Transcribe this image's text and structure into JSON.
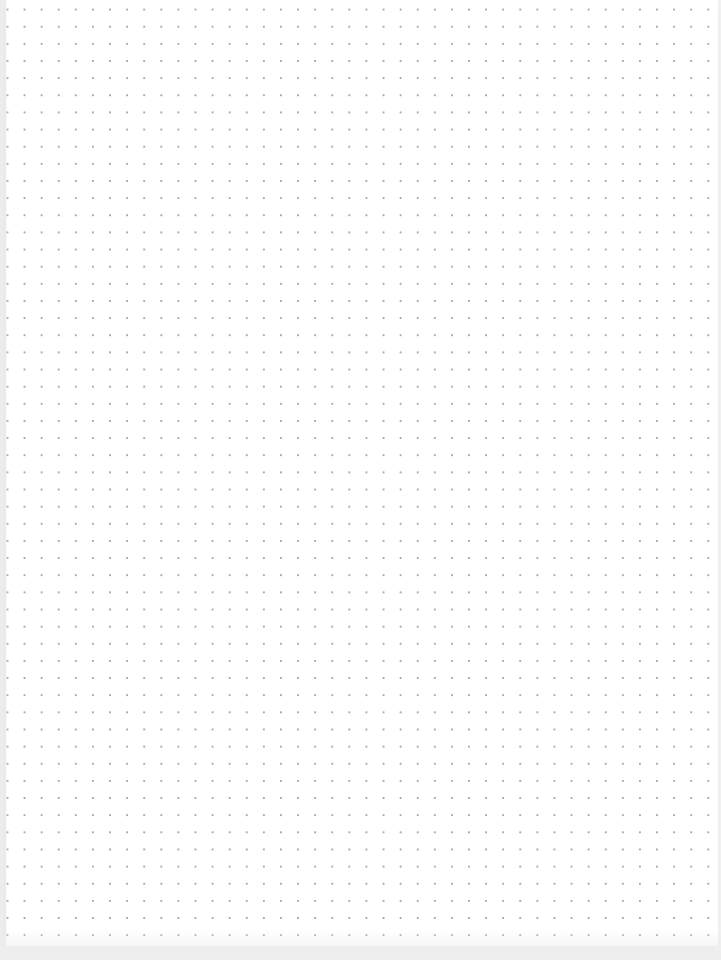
{
  "page": {
    "type": "dot-grid-paper",
    "dot_color": "#a9a9a9",
    "background_color": "#ffffff",
    "dot_spacing_px": 17
  }
}
